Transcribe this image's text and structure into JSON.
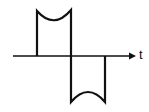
{
  "diagram": {
    "type": "waveform",
    "axis": {
      "label": "t",
      "x_start": 13,
      "x_end": 135,
      "y": 56
    },
    "positive_pulse": {
      "x_left": 37,
      "x_right": 71,
      "top_left_y": 11,
      "top_right_y": 10,
      "dip_y": 21
    },
    "negative_pulse": {
      "x_left": 71,
      "x_right": 105,
      "bottom_y": 102,
      "bump_y": 92
    },
    "colors": {
      "stroke": "#111111",
      "background": "#ffffff"
    }
  }
}
